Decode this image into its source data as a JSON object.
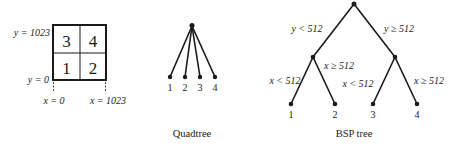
{
  "grid": {
    "y_top_label": "y = 1023",
    "y_bottom_label": "y = 0",
    "x_left_label": "x = 0",
    "x_right_label": "x = 1023",
    "cells": {
      "top_left": "3",
      "top_right": "4",
      "bottom_left": "1",
      "bottom_right": "2"
    }
  },
  "quadtree": {
    "caption": "Quadtree",
    "leaves": [
      "1",
      "2",
      "3",
      "4"
    ]
  },
  "bsp": {
    "caption": "BSP tree",
    "root_left_edge": "y < 512",
    "root_right_edge": "y ≥ 512",
    "left_left_edge": "x < 512",
    "left_right_edge": "x ≥ 512",
    "right_left_edge": "x < 512",
    "right_right_edge": "x ≥ 512",
    "leaves": [
      "1",
      "2",
      "3",
      "4"
    ]
  },
  "colors": {
    "ink": "#1a1a1a",
    "background": "#ffffff"
  }
}
